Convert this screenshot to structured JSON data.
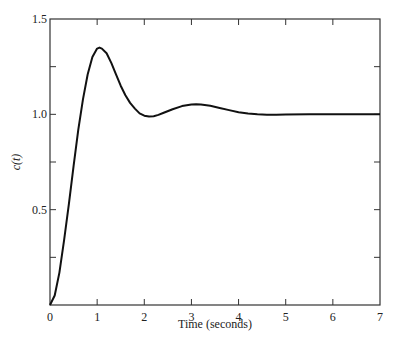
{
  "chart_data": {
    "type": "line",
    "title": "",
    "xlabel": "Time (seconds)",
    "ylabel": "c(t)",
    "xlim": [
      0,
      7
    ],
    "ylim": [
      0,
      1.5
    ],
    "x_ticks": [
      "0",
      "1",
      "2",
      "3",
      "4",
      "5",
      "6",
      "7"
    ],
    "y_ticks": [
      "0.5",
      "1.0",
      "1.5"
    ],
    "y_minor_ticks": [
      0.25,
      0.75,
      1.25
    ],
    "grid": false,
    "legend": null,
    "series": [
      {
        "name": "c(t)",
        "x": [
          0,
          0.1,
          0.2,
          0.3,
          0.4,
          0.5,
          0.6,
          0.7,
          0.8,
          0.9,
          1.0,
          1.05,
          1.1,
          1.2,
          1.3,
          1.4,
          1.5,
          1.6,
          1.7,
          1.8,
          1.9,
          2.0,
          2.1,
          2.2,
          2.3,
          2.4,
          2.6,
          2.8,
          3.0,
          3.1,
          3.2,
          3.4,
          3.6,
          3.8,
          4.0,
          4.2,
          4.4,
          4.6,
          4.8,
          5.0,
          5.5,
          6.0,
          6.5,
          7.0
        ],
        "y": [
          0,
          0.05,
          0.17,
          0.34,
          0.53,
          0.73,
          0.92,
          1.08,
          1.21,
          1.3,
          1.345,
          1.35,
          1.345,
          1.32,
          1.27,
          1.21,
          1.15,
          1.1,
          1.06,
          1.03,
          1.005,
          0.993,
          0.988,
          0.99,
          0.997,
          1.007,
          1.027,
          1.043,
          1.052,
          1.053,
          1.052,
          1.045,
          1.034,
          1.022,
          1.011,
          1.004,
          1.0,
          0.998,
          0.998,
          0.999,
          1.0,
          1.0,
          1.0,
          1.0
        ],
        "color": "#111111"
      }
    ]
  }
}
